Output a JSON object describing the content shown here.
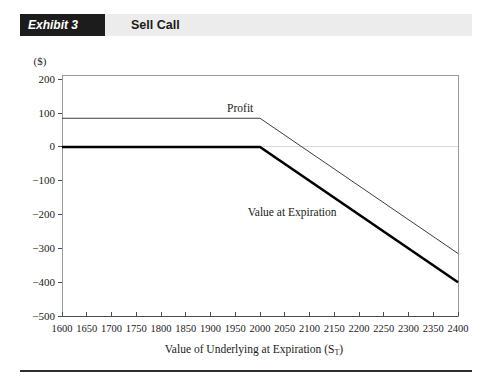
{
  "header": {
    "exhibit_label": "Exhibit 3",
    "title": "Sell Call"
  },
  "colors": {
    "header_box_bg": "#1c1c1c",
    "header_box_text": "#ffffff",
    "header_band_bg": "#ececec",
    "header_title_text": "#1a1a1a",
    "profit_line": "#3d3d3d",
    "value_line": "#000000",
    "zero_gridline": "#d9d9d9",
    "axis_frame": "#9a9a9a",
    "axis_main": "#4d4d4d",
    "tick_text": "#1a1a1a",
    "bottom_rule": "#2f2f2f"
  },
  "chart_data": {
    "type": "line",
    "title": "Sell Call",
    "ylabel": "($)",
    "xlabel": {
      "prefix": "Value of Underlying at Expiration (S",
      "subscript": "T",
      "suffix": ")"
    },
    "xlim": [
      1600,
      2400
    ],
    "ylim": [
      -500,
      213
    ],
    "x_ticks": [
      1600,
      1650,
      1700,
      1750,
      1800,
      1850,
      1900,
      1950,
      2000,
      2050,
      2100,
      2150,
      2200,
      2250,
      2300,
      2350,
      2400
    ],
    "y_ticks": [
      200,
      100,
      0,
      -100,
      -200,
      -300,
      -400,
      -500
    ],
    "grid": "horizontal zero-line only",
    "legend_position": "inline annotations",
    "series": [
      {
        "name": "Profit",
        "points": [
          [
            1600,
            85
          ],
          [
            2000,
            85
          ],
          [
            2400,
            -315
          ]
        ],
        "style": "thin"
      },
      {
        "name": "Value at Expiration",
        "points": [
          [
            1600,
            0
          ],
          [
            2000,
            0
          ],
          [
            2400,
            -400
          ]
        ],
        "style": "thick"
      }
    ],
    "annotations": [
      {
        "label": "Profit",
        "x": 1960,
        "y": 115
      },
      {
        "label": "Value at Expiration",
        "x": 2065,
        "y": -191
      }
    ]
  }
}
